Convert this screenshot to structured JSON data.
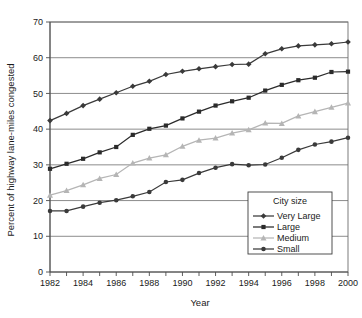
{
  "chart_data": {
    "type": "line",
    "title": "",
    "xlabel": "Year",
    "ylabel": "Percent of highway lane-miles congested",
    "xlim": [
      1982,
      2000
    ],
    "ylim": [
      0,
      70
    ],
    "ytick_step": 10,
    "xtick_label_step": 2,
    "grid": "horizontal",
    "legend_position": "lower-right",
    "legend_title": "City size",
    "x": [
      1982,
      1983,
      1984,
      1985,
      1986,
      1987,
      1988,
      1989,
      1990,
      1991,
      1992,
      1993,
      1994,
      1995,
      1996,
      1997,
      1998,
      1999,
      2000
    ],
    "xtick_labels": [
      "1982",
      "1984",
      "1986",
      "1988",
      "1990",
      "1992",
      "1994",
      "1996",
      "1998",
      "2000"
    ],
    "ytick_labels": [
      "0",
      "10",
      "20",
      "30",
      "40",
      "50",
      "60",
      "70"
    ],
    "series": [
      {
        "name": "Very Large",
        "marker": "diamond",
        "color": "#3a3a3a",
        "values": [
          42.4,
          44.4,
          46.6,
          48.4,
          50.2,
          52.0,
          53.4,
          55.3,
          56.2,
          56.9,
          57.5,
          58.1,
          58.2,
          61.1,
          62.5,
          63.3,
          63.6,
          63.9,
          64.4
        ]
      },
      {
        "name": "Large",
        "marker": "square",
        "color": "#2b2b2b",
        "values": [
          28.9,
          30.3,
          31.7,
          33.5,
          35.0,
          38.4,
          40.1,
          41.0,
          43.0,
          44.9,
          46.6,
          47.8,
          48.8,
          50.8,
          52.4,
          53.7,
          54.4,
          56.0,
          56.1
        ]
      },
      {
        "name": "Medium",
        "marker": "triangle",
        "color": "#b5b5b5",
        "values": [
          21.5,
          22.8,
          24.4,
          26.2,
          27.3,
          30.5,
          31.9,
          32.8,
          35.2,
          36.9,
          37.5,
          38.9,
          39.8,
          41.7,
          41.6,
          43.7,
          44.9,
          46.1,
          47.3
        ]
      },
      {
        "name": "Small",
        "marker": "circle",
        "color": "#3a3a3a",
        "values": [
          17.1,
          17.1,
          18.3,
          19.4,
          20.1,
          21.2,
          22.4,
          25.2,
          25.8,
          27.7,
          29.2,
          30.2,
          29.9,
          30.1,
          32.0,
          34.2,
          35.7,
          36.5,
          37.6
        ]
      }
    ]
  }
}
